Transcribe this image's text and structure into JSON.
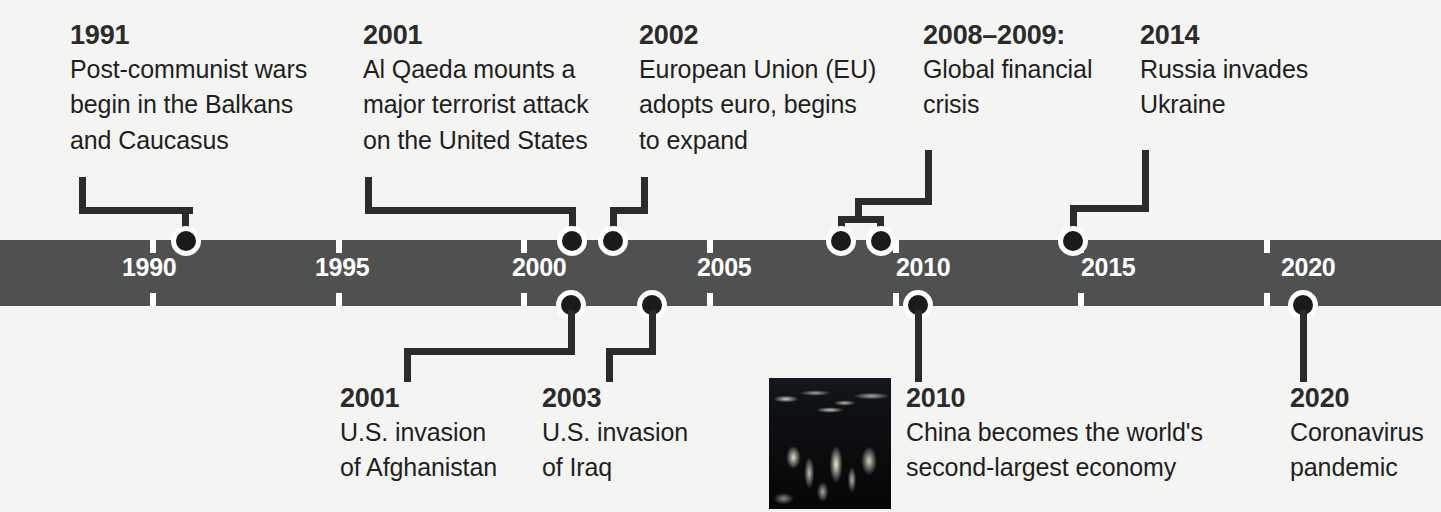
{
  "axis": {
    "years": [
      "1990",
      "1995",
      "2000",
      "2005",
      "2010",
      "2015",
      "2020"
    ],
    "bar_color": "#4f5050",
    "tick_color": "#ffffff",
    "label_color": "#ffffff"
  },
  "marker_color": "#1b1b1b",
  "connector_color": "#2b2b2b",
  "events_above": [
    {
      "year": "1991",
      "description": "Post-communist wars begin in the Balkans and Caucasus",
      "lines": [
        "Post-communist wars",
        "begin in the Balkans",
        "and Caucasus"
      ]
    },
    {
      "year": "2001",
      "description": "Al Qaeda mounts a major terrorist attack on the United States",
      "lines": [
        "Al Qaeda mounts a",
        "major terrorist attack",
        "on the United States"
      ]
    },
    {
      "year": "2002",
      "description": "European Union (EU) adopts euro, begins to expand",
      "lines": [
        "European Union (EU)",
        "adopts euro, begins",
        "to expand"
      ]
    },
    {
      "year": "2008–2009:",
      "description": "Global financial crisis",
      "lines": [
        "Global financial",
        "crisis"
      ]
    },
    {
      "year": "2014",
      "description": "Russia invades Ukraine",
      "lines": [
        "Russia invades",
        "Ukraine"
      ]
    }
  ],
  "events_below": [
    {
      "year": "2001",
      "description": "U.S. invasion of Afghanistan",
      "lines": [
        "U.S. invasion",
        "of Afghanistan"
      ]
    },
    {
      "year": "2003",
      "description": "U.S. invasion of Iraq",
      "lines": [
        "U.S. invasion",
        "of Iraq"
      ]
    },
    {
      "year": "2010",
      "description": "China becomes the world's second-largest economy",
      "lines": [
        "China becomes the world's",
        "second-largest economy"
      ]
    },
    {
      "year": "2020",
      "description": "Coronavirus pandemic",
      "lines": [
        "Coronavirus",
        "pandemic"
      ]
    }
  ],
  "photo": {
    "caption": "night-cityscape-photo"
  }
}
